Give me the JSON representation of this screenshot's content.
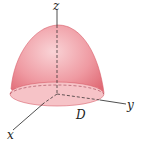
{
  "figure": {
    "labels": {
      "z_axis": "z",
      "y_axis": "y",
      "x_axis": "x",
      "region": "D"
    },
    "colors": {
      "surface_light": "#f7c9cd",
      "surface_mid": "#ee8f97",
      "surface_dark": "#e06a75",
      "base": "#f6c3c7",
      "axis": "#222222"
    }
  }
}
